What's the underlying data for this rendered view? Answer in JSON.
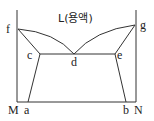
{
  "diagram": {
    "title": "L(용액)",
    "points": {
      "f": "f",
      "g": "g",
      "c": "c",
      "d": "d",
      "e": "e",
      "a": "a",
      "b": "b",
      "M": "M",
      "N": "N"
    },
    "line_color": "#333333"
  }
}
